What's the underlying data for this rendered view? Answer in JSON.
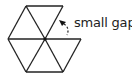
{
  "diagram": {
    "annotation_label": "small gap",
    "stroke_color": "#222222",
    "background": "#ffffff"
  }
}
